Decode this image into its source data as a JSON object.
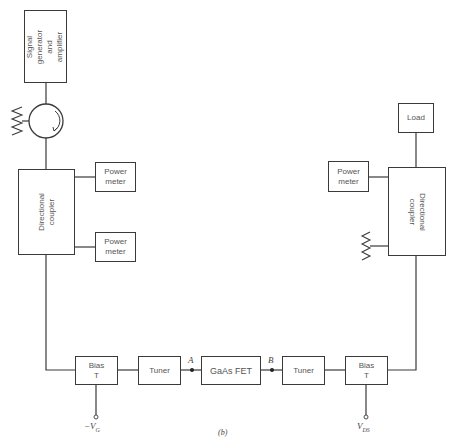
{
  "figure": {
    "caption": "(b)",
    "blocks": {
      "signal_generator": "Signal\ngenerator\nand\namplifier",
      "directional_coupler_left": "Directional\ncoupler",
      "power_meter_top_left": "Power\nmeter",
      "power_meter_bottom_left": "Power\nmeter",
      "bias_t_left": "Bias\nT",
      "tuner_input": "Tuner",
      "gaas_fet": "GaAs FET",
      "tuner_output": "Tuner",
      "bias_t_right": "Bias\nT",
      "directional_coupler_right": "Directional\ncoupler",
      "power_meter_right": "Power\nmeter",
      "load": "Load"
    },
    "nodes": {
      "a": "A",
      "b": "B"
    },
    "terminals": {
      "gate_voltage": {
        "prefix": "−V",
        "sub": "G"
      },
      "drain_voltage": {
        "prefix": "V",
        "sub": "DS"
      }
    },
    "symbols": [
      "circulator",
      "termination-resistor-left",
      "termination-resistor-right"
    ],
    "colors": {
      "line": "#3a3a3a",
      "background": "#ffffff"
    }
  }
}
